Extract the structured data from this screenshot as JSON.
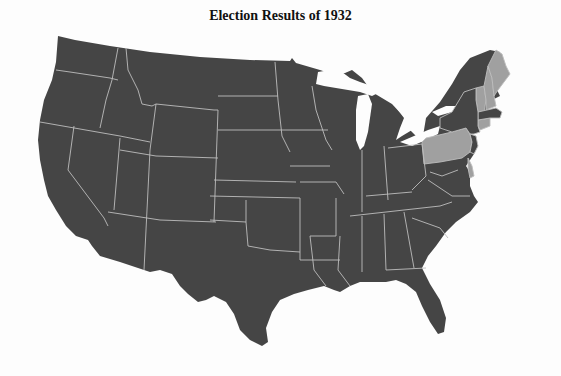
{
  "title": "Election Results of 1932",
  "colors": {
    "democratic": "#454545",
    "republican": "#a0a0a0",
    "border": "#bdbdbd",
    "background": "#fdfdfd"
  },
  "map": {
    "region": "Contiguous United States",
    "republican_states": [
      "Maine",
      "New Hampshire",
      "Vermont",
      "Connecticut",
      "Pennsylvania",
      "Delaware"
    ],
    "democratic_states": [
      "Washington",
      "Oregon",
      "California",
      "Nevada",
      "Idaho",
      "Montana",
      "Wyoming",
      "Utah",
      "Arizona",
      "Colorado",
      "New Mexico",
      "North Dakota",
      "South Dakota",
      "Nebraska",
      "Kansas",
      "Oklahoma",
      "Texas",
      "Minnesota",
      "Iowa",
      "Missouri",
      "Arkansas",
      "Louisiana",
      "Wisconsin",
      "Illinois",
      "Michigan",
      "Indiana",
      "Ohio",
      "Kentucky",
      "Tennessee",
      "Mississippi",
      "Alabama",
      "Georgia",
      "Florida",
      "South Carolina",
      "North Carolina",
      "Virginia",
      "West Virginia",
      "Maryland",
      "New Jersey",
      "New York",
      "Massachusetts",
      "Rhode Island"
    ]
  }
}
